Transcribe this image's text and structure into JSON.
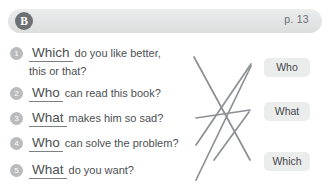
{
  "header": {
    "section_badge": "B",
    "page_label": "p. 13"
  },
  "questions": [
    {
      "number": "1",
      "answer_word": "Which",
      "text": "do you like better,",
      "continuation": "this or that?"
    },
    {
      "number": "2",
      "answer_word": "Who",
      "text": "can read this book?",
      "continuation": ""
    },
    {
      "number": "3",
      "answer_word": "What",
      "text": "makes him so sad?",
      "continuation": ""
    },
    {
      "number": "4",
      "answer_word": "Who",
      "text": "can solve the problem?",
      "continuation": ""
    },
    {
      "number": "5",
      "answer_word": "What",
      "text": "do you want?",
      "continuation": ""
    }
  ],
  "options": [
    {
      "label": "Who"
    },
    {
      "label": "What"
    },
    {
      "label": "Which"
    }
  ],
  "colors": {
    "line": "#8c9093",
    "text": "#4c4f52",
    "bar": "#e4e5e6",
    "badge": "#6e7173",
    "option_bg": "#ebecec"
  }
}
